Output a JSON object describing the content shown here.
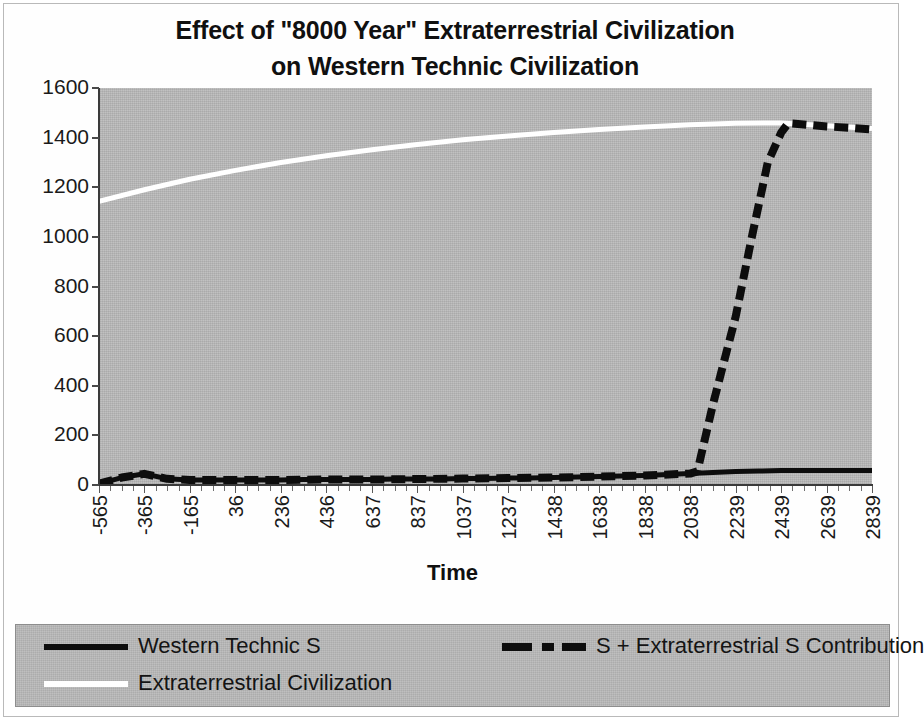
{
  "chart_data": {
    "type": "line",
    "title": "Effect of \"8000 Year\" Extraterrestrial Civilization on Western Technic Civilization",
    "title_line1": "Effect of \"8000 Year\" Extraterrestrial Civilization",
    "title_line2": "on Western Technic Civilization",
    "xlabel": "Time",
    "ylabel": "",
    "xlim": [
      -565,
      2839
    ],
    "ylim": [
      0,
      1600
    ],
    "ytick_values": [
      0,
      200,
      400,
      600,
      800,
      1000,
      1200,
      1400,
      1600
    ],
    "ytick_labels": [
      "0",
      "200",
      "400",
      "600",
      "800",
      "1000",
      "1200",
      "1400",
      "1600"
    ],
    "xtick_labels": [
      "-565",
      "-365",
      "-165",
      "36",
      "236",
      "436",
      "637",
      "837",
      "1037",
      "1237",
      "1438",
      "1638",
      "1838",
      "2038",
      "2239",
      "2439",
      "2639",
      "2839"
    ],
    "xtick_values": [
      -565,
      -365,
      -165,
      36,
      236,
      436,
      637,
      837,
      1037,
      1237,
      1438,
      1638,
      1838,
      2038,
      2239,
      2439,
      2639,
      2839
    ],
    "grid": false,
    "legend_position": "bottom",
    "plot_background": "#b9b9b9",
    "series": [
      {
        "name": "Western Technic S",
        "style": "solid",
        "color": "#0d0d0d",
        "x": [
          -565,
          -465,
          -365,
          -265,
          -165,
          -65,
          36,
          136,
          236,
          336,
          436,
          536,
          637,
          737,
          837,
          937,
          1037,
          1137,
          1237,
          1337,
          1438,
          1538,
          1638,
          1738,
          1838,
          1938,
          2038,
          2138,
          2239,
          2339,
          2439,
          2539,
          2639,
          2739,
          2839
        ],
        "values": [
          5,
          30,
          45,
          25,
          20,
          20,
          20,
          20,
          20,
          22,
          22,
          22,
          22,
          24,
          24,
          24,
          26,
          26,
          28,
          28,
          30,
          32,
          34,
          36,
          38,
          42,
          46,
          50,
          54,
          56,
          58,
          58,
          58,
          58,
          58
        ]
      },
      {
        "name": "Extraterrestrial Civilization",
        "style": "solid",
        "color": "#ffffff",
        "x": [
          -565,
          -365,
          -165,
          36,
          236,
          436,
          637,
          837,
          1037,
          1237,
          1438,
          1638,
          1838,
          2038,
          2239,
          2439,
          2639,
          2839
        ],
        "values": [
          1143,
          1190,
          1232,
          1268,
          1300,
          1327,
          1351,
          1372,
          1391,
          1407,
          1421,
          1433,
          1443,
          1452,
          1458,
          1459,
          1448,
          1437
        ]
      },
      {
        "name": "S + Extraterrestrial S Contribution",
        "style": "dashed",
        "color": "#0d0d0d",
        "x": [
          -565,
          -465,
          -365,
          -265,
          -165,
          -65,
          36,
          236,
          436,
          637,
          837,
          1037,
          1237,
          1438,
          1638,
          1838,
          2038,
          2070,
          2140,
          2239,
          2310,
          2380,
          2439,
          2470,
          2550,
          2639,
          2739,
          2839
        ],
        "values": [
          5,
          30,
          45,
          25,
          20,
          20,
          20,
          20,
          22,
          22,
          24,
          26,
          28,
          30,
          34,
          38,
          46,
          55,
          330,
          680,
          1000,
          1300,
          1420,
          1458,
          1452,
          1445,
          1440,
          1433
        ]
      }
    ]
  },
  "legend": {
    "items": [
      {
        "label": "Western Technic S",
        "style": "solid-black"
      },
      {
        "label": "Extraterrestrial Civilization",
        "style": "solid-white"
      },
      {
        "label": "S + Extraterrestrial S Contribution",
        "style": "dashed-black"
      }
    ]
  }
}
